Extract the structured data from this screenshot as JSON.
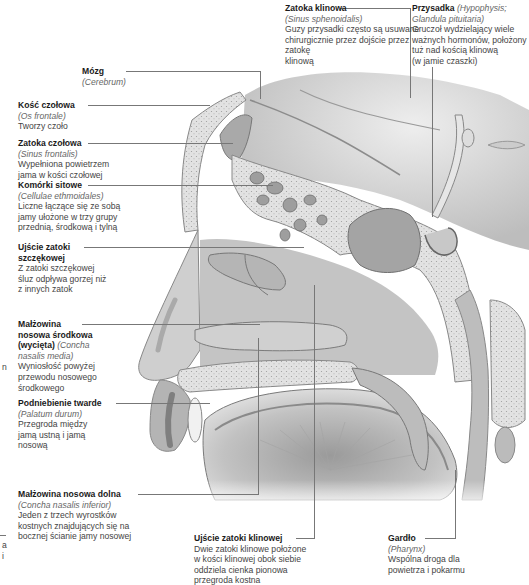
{
  "figure": {
    "labels": [
      {
        "id": "zatoka-klinowa",
        "title": "Zatoka klinowa",
        "latin": "(Sinus sphenoidalis)",
        "desc": [
          "Guzy przysadki często są usuwane",
          "chirurgicznie przez dojście przez zatokę",
          "klinową"
        ]
      },
      {
        "id": "przysadka",
        "title": "Przysadka",
        "latin": "(Hypophysis; Glandula pituitaria)",
        "desc": [
          "Gruczoł wydzielający wiele",
          "ważnych hormonów, położony",
          "tuż nad kością klinową",
          "(w jamie czaszki)"
        ]
      },
      {
        "id": "mozg",
        "title": "Mózg",
        "latin": "(Cerebrum)",
        "desc": []
      },
      {
        "id": "kosc-czolowa",
        "title": "Kość czołowa",
        "latin": "(Os frontale)",
        "desc": [
          "Tworzy czoło"
        ]
      },
      {
        "id": "zatoka-czolowa",
        "title": "Zatoka czołowa",
        "latin": "(Sinus frontalis)",
        "desc": [
          "Wypełniona powietrzem",
          "jama w kości czołowej"
        ]
      },
      {
        "id": "komorki-sitowe",
        "title": "Komórki sitowe",
        "latin": "(Cellulae ethmoidales)",
        "desc": [
          "Liczne łączące się ze sobą",
          "jamy ułożone w trzy grupy",
          "przednią, środkową i tylną"
        ]
      },
      {
        "id": "ujscie-zatoki-szczekowej",
        "title": "Ujście zatoki szczękowej",
        "title_lines": [
          "Ujście zatoki",
          "szczękowej"
        ],
        "latin": "",
        "desc": [
          "Z zatoki szczękowej",
          "śluz odpływa gorzej niż",
          "z innych zatok"
        ]
      },
      {
        "id": "malzowina-srodkowa",
        "title_lines": [
          "Małżowina",
          "nosowa środkowa",
          "(wycięta)"
        ],
        "latin_lines": [
          "(Concha",
          "nasalis media)"
        ],
        "desc": [
          "Wyniosłość powyżej",
          "przewodu nosowego",
          "środkowego"
        ]
      },
      {
        "id": "podniebienie-twarde",
        "title": "Podniebienie twarde",
        "latin": "(Palatum durum)",
        "desc": [
          "Przegroda między",
          "jamą ustną i jamą",
          "nosową"
        ]
      },
      {
        "id": "malzowina-dolna",
        "title": "Małżowina nosowa dolna",
        "latin": "(Concha nasalis inferior)",
        "desc": [
          "Jeden z trzech wyrostków",
          "kostnych znajdujących się na",
          "bocznej ścianie jamy nosowej"
        ]
      },
      {
        "id": "ujscie-zatoki-klinowej",
        "title": "Ujście zatoki klinowej",
        "latin": "",
        "desc": [
          "Dwie zatoki klinowe położone",
          "w kości klinowej obok siebie",
          "oddziela cienka pionowa",
          "przegroda kostna"
        ]
      },
      {
        "id": "gardlo",
        "title": "Gardło",
        "latin": "(Pharynx)",
        "desc": [
          "Wspólna droga dla",
          "powietrza i pokarmu"
        ]
      }
    ],
    "edge_fragments": {
      "left_mid": "n",
      "left_bottom": [
        "a",
        "i"
      ]
    },
    "colors": {
      "line": "#777777",
      "tissue_light": "#e4e4e4",
      "tissue_mid": "#b9b9b9",
      "tissue_dark": "#8a8a8a",
      "bone": "#d8d8d8"
    }
  }
}
